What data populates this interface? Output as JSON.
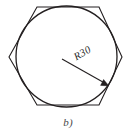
{
  "figure": {
    "caption": "b)",
    "background_color": "#ffffff",
    "stroke_color": "#231f20",
    "dimension": {
      "label": "R30",
      "value": 30,
      "symbol": "R",
      "leader_angle_deg": -35,
      "leader_start": [
        62,
        59
      ],
      "leader_end": [
        108,
        85
      ],
      "arrow_at": "end"
    },
    "shapes": {
      "circle": {
        "name": "circle",
        "center": [
          66.5,
          56.5
        ],
        "radius": 50.5
      },
      "hexagon": {
        "name": "hexagon",
        "orientation": "flat-top",
        "vertices": [
          [
            37,
            7
          ],
          [
            99,
            7
          ],
          [
            122,
            57
          ],
          [
            99,
            105
          ],
          [
            37,
            105
          ],
          [
            9,
            57
          ]
        ]
      }
    }
  }
}
